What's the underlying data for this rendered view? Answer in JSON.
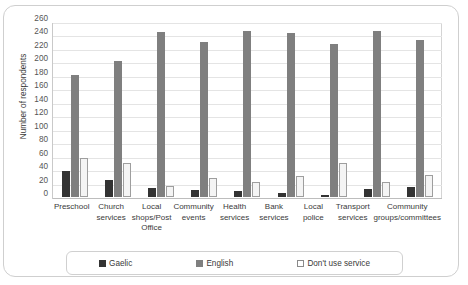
{
  "chart_data": {
    "type": "bar",
    "title": "",
    "xlabel": "",
    "ylabel": "Number of respondents",
    "ylim": [
      0,
      260
    ],
    "ytick_step": 20,
    "yticks": [
      260,
      240,
      220,
      200,
      180,
      160,
      140,
      120,
      100,
      80,
      60,
      40,
      20,
      0
    ],
    "grid": "horizontal",
    "legend_position": "bottom",
    "categories": [
      "Preschool",
      "Church services",
      "Local shops/Post Office",
      "Community events",
      "Health services",
      "Bank services",
      "Local police",
      "Transport services",
      "Community groups/committees"
    ],
    "series": [
      {
        "name": "Gaelic",
        "color": "#333333",
        "values": [
          38,
          26,
          14,
          10,
          9,
          6,
          3,
          12,
          15
        ]
      },
      {
        "name": "English",
        "color": "#7f7f7f",
        "values": [
          181,
          202,
          245,
          231,
          247,
          243,
          228,
          246,
          233
        ]
      },
      {
        "name": "Don't use service",
        "color": "#f4f4f4",
        "values": [
          58,
          50,
          17,
          28,
          23,
          31,
          50,
          22,
          33
        ]
      }
    ]
  },
  "legend": {
    "items": [
      {
        "label": "Gaelic"
      },
      {
        "label": "English"
      },
      {
        "label": "Don't use service"
      }
    ]
  }
}
